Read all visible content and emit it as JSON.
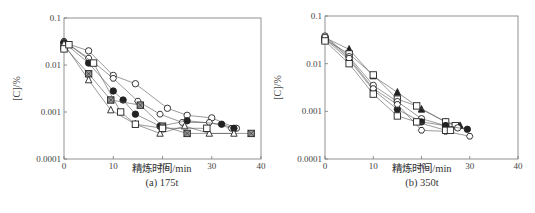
{
  "chart_data": [
    {
      "type": "line",
      "title": "(a) 175t",
      "xlabel": "精炼时间/min",
      "ylabel": "[C]/%",
      "xlim": [
        0,
        40
      ],
      "ylim": [
        0.0001,
        0.1
      ],
      "yscale": "log",
      "xticks": [
        "0",
        "10",
        "20",
        "30",
        "40"
      ],
      "yticks": [
        "0.0001",
        "0.001",
        "0.01",
        "0.1"
      ],
      "grid": false,
      "legend": null,
      "series": [
        {
          "name": "open-circle",
          "marker": "circle-open",
          "x": [
            0,
            5,
            10,
            14.5,
            21,
            25,
            30,
            35
          ],
          "y": [
            0.03,
            0.02,
            0.006,
            0.004,
            0.0012,
            0.00085,
            0.00075,
            0.00045
          ]
        },
        {
          "name": "open-hexagon",
          "marker": "hexagon-open",
          "x": [
            0,
            5,
            10,
            15,
            19.5,
            24,
            29.5,
            34
          ],
          "y": [
            0.032,
            0.014,
            0.0052,
            0.0017,
            0.0009,
            0.0006,
            0.0006,
            0.00045
          ]
        },
        {
          "name": "filled-circle",
          "marker": "circle-filled",
          "x": [
            0,
            5,
            10,
            12,
            14.5,
            19.5,
            25,
            32,
            34.5
          ],
          "y": [
            0.03,
            0.011,
            0.0028,
            0.0018,
            0.0009,
            0.0005,
            0.00065,
            0.00055,
            0.00045
          ]
        },
        {
          "name": "hatched-square",
          "marker": "square-hatched",
          "x": [
            0,
            5,
            9.5,
            15.5,
            20,
            25,
            38
          ],
          "y": [
            0.025,
            0.0065,
            0.0018,
            0.0014,
            0.0005,
            0.00035,
            0.00035
          ]
        },
        {
          "name": "open-triangle",
          "marker": "triangle-open",
          "x": [
            0,
            5,
            9.5,
            14.5,
            19.5,
            24.5,
            29.5,
            34.5
          ],
          "y": [
            0.028,
            0.0048,
            0.0011,
            0.00055,
            0.00035,
            0.0005,
            0.00035,
            0.00035
          ]
        },
        {
          "name": "open-square",
          "marker": "square-open",
          "x": [
            0,
            1,
            6,
            11.5,
            14.5,
            20,
            29
          ],
          "y": [
            0.022,
            0.027,
            0.011,
            0.001,
            0.00055,
            0.00045,
            0.00045
          ]
        }
      ]
    },
    {
      "type": "line",
      "title": "(b) 350t",
      "xlabel": "精炼时间/min",
      "ylabel": "[C]/%",
      "xlim": [
        0,
        40
      ],
      "ylim": [
        0.0001,
        0.1
      ],
      "yscale": "log",
      "xticks": [
        "0",
        "10",
        "20",
        "30",
        "40"
      ],
      "yticks": [
        "0.0001",
        "0.001",
        "0.01",
        "0.1"
      ],
      "grid": false,
      "legend": null,
      "series": [
        {
          "name": "filled-triangle",
          "marker": "triangle-filled",
          "x": [
            0,
            5,
            10,
            15,
            20,
            25,
            28
          ],
          "y": [
            0.035,
            0.02,
            0.0055,
            0.0025,
            0.0011,
            0.0006,
            0.0005
          ]
        },
        {
          "name": "open-square-a",
          "marker": "square-open",
          "x": [
            0,
            5,
            10,
            15,
            19,
            25,
            27
          ],
          "y": [
            0.032,
            0.016,
            0.0058,
            0.0018,
            0.0013,
            0.0006,
            0.0005
          ]
        },
        {
          "name": "open-circle",
          "marker": "circle-open",
          "x": [
            0,
            5,
            10,
            15,
            20,
            25,
            27.5
          ],
          "y": [
            0.038,
            0.014,
            0.0035,
            0.0016,
            0.0007,
            0.0005,
            0.00045
          ]
        },
        {
          "name": "filled-circle",
          "marker": "circle-filled",
          "x": [
            0,
            5,
            10,
            15,
            20,
            25,
            29.5
          ],
          "y": [
            0.033,
            0.012,
            0.0028,
            0.0011,
            0.0006,
            0.0005,
            0.00042
          ]
        },
        {
          "name": "open-hexagon",
          "marker": "hexagon-open",
          "x": [
            0,
            5,
            10,
            15,
            20,
            25,
            30
          ],
          "y": [
            0.036,
            0.013,
            0.003,
            0.0014,
            0.0004,
            0.00038,
            0.0003
          ]
        },
        {
          "name": "open-square-b",
          "marker": "square-open",
          "x": [
            0,
            5,
            10,
            15,
            19,
            25,
            26
          ],
          "y": [
            0.03,
            0.01,
            0.0023,
            0.0008,
            0.0006,
            0.0004,
            0.0004
          ]
        }
      ]
    }
  ],
  "panels": {
    "a": {
      "caption": "(a) 175t",
      "xlabel": "精炼时间/min",
      "ylabel": "[C]/%"
    },
    "b": {
      "caption": "(b) 350t",
      "xlabel": "精炼时间/min",
      "ylabel": "[C]/%"
    }
  }
}
